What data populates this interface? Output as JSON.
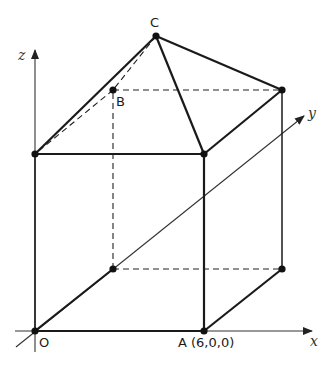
{
  "figure": {
    "type": "3D geometry diagram: cuboid with pyramid roof on coordinate axes",
    "axes": {
      "x": {
        "label": "x"
      },
      "y": {
        "label": "y"
      },
      "z": {
        "label": "z"
      }
    },
    "points": {
      "O": {
        "label": "O"
      },
      "A": {
        "label": "A (6,0,0)"
      },
      "B": {
        "label": "B"
      },
      "C": {
        "label": "C"
      }
    },
    "colors": {
      "line": "#1a1a1a",
      "axis": "#333333",
      "background": "#ffffff"
    }
  }
}
